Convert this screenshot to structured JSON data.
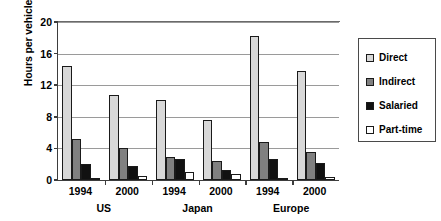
{
  "chart_data": {
    "type": "bar",
    "title": "",
    "xlabel": "",
    "ylabel": "Hours per vehicle",
    "ylim": [
      0,
      20
    ],
    "yticks": [
      0,
      4,
      8,
      12,
      16,
      20
    ],
    "grid": true,
    "legend_position": "right",
    "categories": [
      "1994",
      "2000",
      "1994",
      "2000",
      "1994",
      "2000"
    ],
    "group_labels": [
      "US",
      "Japan",
      "Europe"
    ],
    "series": [
      {
        "name": "Direct",
        "color": "#d8d8d8",
        "values": [
          14.4,
          10.7,
          10.1,
          7.6,
          18.2,
          13.8
        ]
      },
      {
        "name": "Indirect",
        "color": "#808080",
        "values": [
          5.2,
          4.1,
          2.9,
          2.4,
          4.8,
          3.6
        ]
      },
      {
        "name": "Salaried",
        "color": "#111111",
        "values": [
          2.0,
          1.8,
          2.7,
          1.3,
          2.6,
          2.1
        ]
      },
      {
        "name": "Part-time",
        "color": "#ffffff",
        "values": [
          0.3,
          0.5,
          1.0,
          0.7,
          0.1,
          0.4
        ]
      }
    ]
  },
  "axis": {
    "y_title": "Hours per vehicle"
  },
  "legend": {
    "items": [
      {
        "label": "Direct"
      },
      {
        "label": "Indirect"
      },
      {
        "label": "Salaried"
      },
      {
        "label": "Part-time"
      }
    ]
  }
}
